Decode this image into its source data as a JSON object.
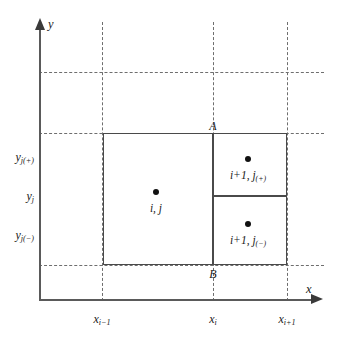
{
  "figure": {
    "type": "diagram",
    "background_color": "#ffffff",
    "line_color": "#4a4a4a",
    "grid_color": "#6e6e6e",
    "dot_color": "#111111"
  },
  "axes": {
    "x_label": "x",
    "y_label": "y"
  },
  "x_ticks": [
    {
      "label_main": "x",
      "label_sub": "i−1",
      "x": 102
    },
    {
      "label_main": "x",
      "label_sub": "i",
      "x": 213
    },
    {
      "label_main": "x",
      "label_sub": "i+1",
      "x": 287
    }
  ],
  "y_ticks": [
    {
      "label_main": "y",
      "label_sub": "j(+)",
      "y": 157
    },
    {
      "label_main": "y",
      "label_sub": "j",
      "y": 196
    },
    {
      "label_main": "y",
      "label_sub": "j(−)",
      "y": 235
    }
  ],
  "grid": {
    "vertical_x": [
      102,
      213,
      287
    ],
    "horizontal_y": [
      72,
      133,
      265
    ]
  },
  "cells": [
    {
      "name": "cell-i-j",
      "label_main": "i, j",
      "label_sub": "",
      "left": 103,
      "top": 133,
      "width": 110,
      "height": 132,
      "dot_x": 156,
      "dot_y": 192
    },
    {
      "name": "cell-i-plus-1-j-plus",
      "label_main": "i+1, j",
      "label_sub": "(+)",
      "left": 213,
      "top": 133,
      "width": 74,
      "height": 63,
      "dot_x": 248,
      "dot_y": 159
    },
    {
      "name": "cell-i-plus-1-j-minus",
      "label_main": "i+1, j",
      "label_sub": "(−)",
      "left": 213,
      "top": 196,
      "width": 74,
      "height": 69,
      "dot_x": 248,
      "dot_y": 224
    }
  ],
  "face_points": [
    {
      "label": "A",
      "x": 213,
      "y": 127
    },
    {
      "label": "B",
      "x": 213,
      "y": 271
    }
  ]
}
